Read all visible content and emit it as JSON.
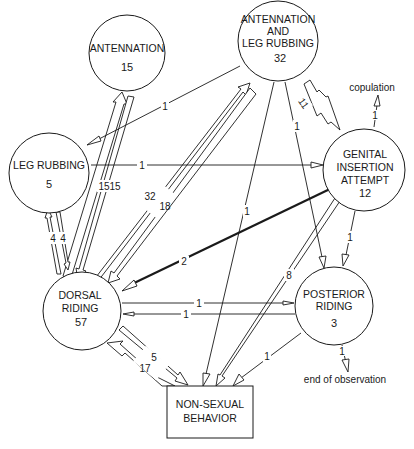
{
  "diagram": {
    "type": "behavioral transition diagram",
    "colors": {
      "ink": "#1a1a1a",
      "background": "#ffffff"
    },
    "nodes": [
      {
        "id": "antennation",
        "shape": "circle",
        "label_lines": [
          "ANTENNATION"
        ],
        "count": "15",
        "cx": 127,
        "cy": 53,
        "r": 38
      },
      {
        "id": "antennation_leg_rubbing",
        "shape": "circle",
        "label_lines": [
          "ANTENNATION",
          "AND",
          "LEG RUBBING"
        ],
        "count": "32",
        "cx": 278,
        "cy": 41,
        "r": 40
      },
      {
        "id": "leg_rubbing",
        "shape": "circle",
        "label_lines": [
          "LEG RUBBING"
        ],
        "count": "5",
        "cx": 49,
        "cy": 173,
        "r": 40
      },
      {
        "id": "genital_insertion_attempt",
        "shape": "circle",
        "label_lines": [
          "GENITAL",
          "INSERTION",
          "ATTEMPT"
        ],
        "count": "12",
        "cx": 364,
        "cy": 170,
        "r": 41
      },
      {
        "id": "dorsal_riding",
        "shape": "circle",
        "label_lines": [
          "DORSAL",
          "RIDING"
        ],
        "count": "57",
        "cx": 82,
        "cy": 311,
        "r": 39
      },
      {
        "id": "posterior_riding",
        "shape": "circle",
        "label_lines": [
          "POSTERIOR",
          "RIDING"
        ],
        "count": "3",
        "cx": 334,
        "cy": 306,
        "r": 39
      },
      {
        "id": "non_sexual_behavior",
        "shape": "box",
        "label_lines": [
          "NON-SEXUAL",
          "BEHAVIOR"
        ],
        "count": "",
        "x": 167,
        "y": 385,
        "w": 86,
        "h": 52
      }
    ],
    "edges": [
      {
        "from": "dorsal_riding",
        "to": "antennation",
        "label": "15",
        "width": "wide"
      },
      {
        "from": "antennation",
        "to": "dorsal_riding",
        "label": "15",
        "width": "wide"
      },
      {
        "from": "dorsal_riding",
        "to": "antennation_leg_rubbing",
        "label": "32",
        "width": "wide"
      },
      {
        "from": "antennation_leg_rubbing",
        "to": "dorsal_riding",
        "label": "18",
        "width": "wide"
      },
      {
        "from": "dorsal_riding",
        "to": "leg_rubbing",
        "label": "4",
        "width": "medium"
      },
      {
        "from": "leg_rubbing",
        "to": "dorsal_riding",
        "label": "4",
        "width": "medium"
      },
      {
        "from": "antennation_leg_rubbing",
        "to": "leg_rubbing",
        "label": "1",
        "width": "thin"
      },
      {
        "from": "leg_rubbing",
        "to": "genital_insertion_attempt",
        "label": "1",
        "width": "thin"
      },
      {
        "from": "antennation_leg_rubbing",
        "to": "genital_insertion_attempt",
        "label": "11",
        "width": "medium"
      },
      {
        "from": "genital_insertion_attempt",
        "to": "dorsal_riding",
        "label": "2",
        "width": "bold-line"
      },
      {
        "from": "genital_insertion_attempt",
        "to": "non_sexual_behavior",
        "label": "8",
        "width": "narrow"
      },
      {
        "from": "genital_insertion_attempt",
        "to": "posterior_riding",
        "label": "1",
        "width": "thin"
      },
      {
        "from": "antennation_leg_rubbing",
        "to": "posterior_riding",
        "label": "1",
        "width": "thin"
      },
      {
        "from": "antennation_leg_rubbing",
        "to": "non_sexual_behavior",
        "label": "1",
        "width": "thin"
      },
      {
        "from": "dorsal_riding",
        "to": "posterior_riding",
        "label": "1",
        "width": "thin"
      },
      {
        "from": "posterior_riding",
        "to": "dorsal_riding",
        "label": "1",
        "width": "thin"
      },
      {
        "from": "posterior_riding",
        "to": "non_sexual_behavior",
        "label": "1",
        "width": "thin"
      },
      {
        "from": "dorsal_riding",
        "to": "non_sexual_behavior",
        "label": "5",
        "width": "medium"
      },
      {
        "from": "non_sexual_behavior",
        "to": "dorsal_riding",
        "label": "17",
        "width": "wide"
      },
      {
        "from": "genital_insertion_attempt",
        "to": "copulation",
        "label": "1",
        "width": "thin"
      },
      {
        "from": "posterior_riding",
        "to": "end_of_observation",
        "label": "1",
        "width": "thin"
      }
    ],
    "external_outcomes": [
      {
        "id": "copulation",
        "label": "copulation"
      },
      {
        "id": "end_of_observation",
        "label": "end of observation"
      }
    ]
  }
}
